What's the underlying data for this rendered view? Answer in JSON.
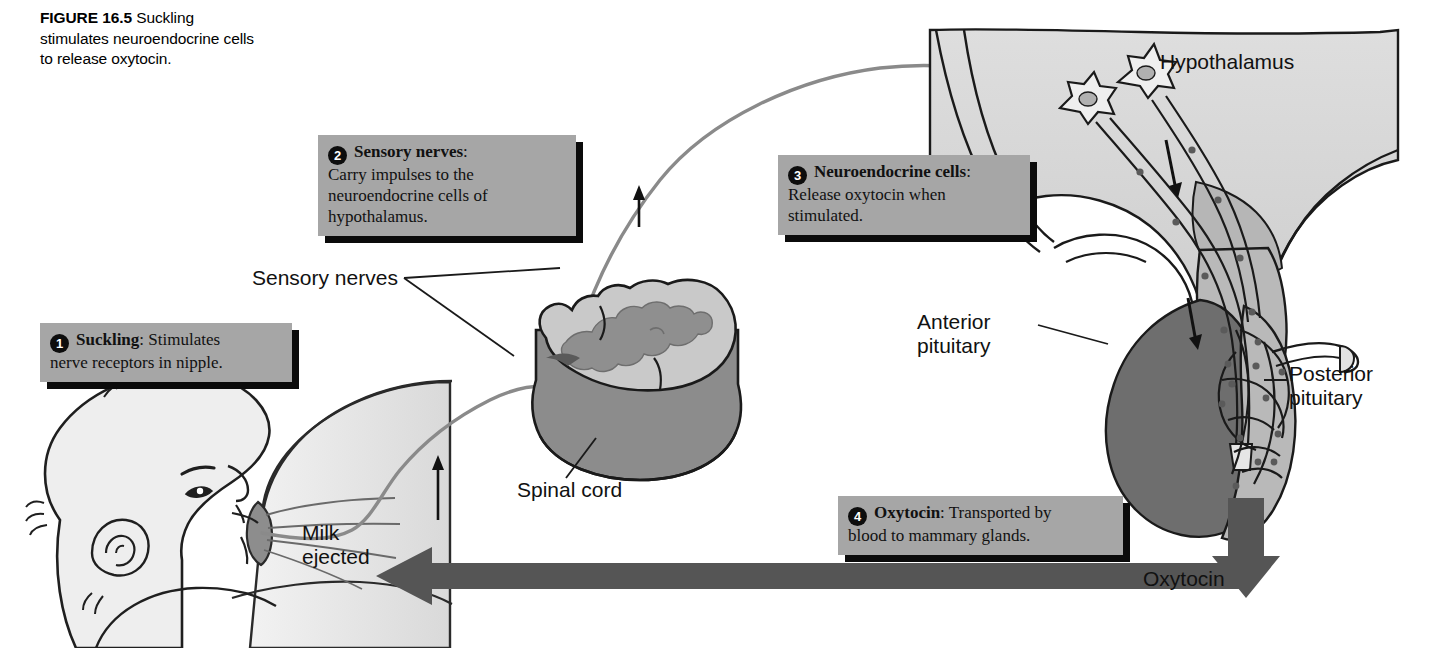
{
  "figure": {
    "number_label": "FIGURE 16.5",
    "caption": "Suckling stimulates neuroendocrine cells to release oxytocin.",
    "topic": "oxytocin milk let-down reflex"
  },
  "callouts": [
    {
      "number": "1",
      "label": "Suckling",
      "separator": ":",
      "text": " Stimulates nerve receptors in nipple.",
      "first_line_rest": " Stimulates",
      "remaining_lines": "nerve receptors in nipple."
    },
    {
      "number": "2",
      "label": "Sensory nerves",
      "separator": ":",
      "text": " Carry impulses to the neuroendocrine cells of hypothalamus.",
      "first_line_rest": "",
      "remaining_lines": "Carry impulses to the neuroendocrine cells of hypothalamus."
    },
    {
      "number": "3",
      "label": "Neuroendocrine cells",
      "separator": ":",
      "text": " Release oxytocin when stimulated.",
      "first_line_rest": "",
      "remaining_lines": "Release oxytocin when stimulated."
    },
    {
      "number": "4",
      "label": "Oxytocin",
      "separator": ":",
      "text": " Transported by blood to mammary glands.",
      "first_line_rest": " Transported by",
      "remaining_lines": "blood to mammary glands."
    }
  ],
  "anatomy_labels": {
    "hypothalamus": "Hypothalamus",
    "sensory_nerves": "Sensory nerves",
    "spinal_cord": "Spinal cord",
    "anterior_pituitary_line1": "Anterior",
    "anterior_pituitary_line2": "pituitary",
    "posterior_pituitary_line1": "Posterior",
    "posterior_pituitary_line2": "pituitary",
    "milk_ejected_line1": "Milk",
    "milk_ejected_line2": "ejected",
    "oxytocin_arrow": "Oxytocin"
  },
  "colors": {
    "callout_fill": "#a6a6a6",
    "callout_shadow": "#0b0b0b",
    "number_badge": "#0d0d0d",
    "anterior_pituitary": "#6e6e6e",
    "posterior_pituitary": "#b9b9b9",
    "hypothalamus_tissue": "#d6d6d6",
    "spinal_cord_white_matter": "#c9c9c9",
    "spinal_cord_gray_matter": "#8f8f8f",
    "spinal_cord_side": "#8c8c8c",
    "oxytocin_arrow": "#555555",
    "nerve_path": "#8a8a8a",
    "breast_tissue": "#e2e2e2",
    "outline": "#1a1a1a",
    "background": "#ffffff"
  }
}
